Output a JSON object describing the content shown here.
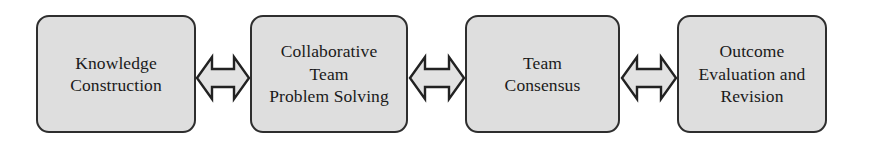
{
  "diagram": {
    "type": "linear-bidirectional-flow",
    "background_color": "#ffffff",
    "box_fill_color": "#dedede",
    "box_border_color": "#2e2e2e",
    "text_color": "#1a1a1a",
    "arrow_fill_color": "#e2e2e2",
    "arrow_stroke_color": "#222222",
    "nodes": [
      {
        "id": "knowledge-construction",
        "label": "Knowledge\nConstruction",
        "lines": [
          "Knowledge",
          "Construction"
        ],
        "x": 36,
        "y": 15,
        "width": 160,
        "height": 118
      },
      {
        "id": "collaborative-team-problem-solving",
        "label": "Collaborative\nTeam\nProblem Solving",
        "lines": [
          "Collaborative",
          "Team",
          "Problem Solving"
        ],
        "x": 250,
        "y": 15,
        "width": 158,
        "height": 118
      },
      {
        "id": "team-consensus",
        "label": "Team\nConsensus",
        "lines": [
          "Team",
          "Consensus"
        ],
        "x": 465,
        "y": 15,
        "width": 155,
        "height": 118
      },
      {
        "id": "outcome-evaluation-and-revision",
        "label": "Outcome\nEvaluation and\nRevision",
        "lines": [
          "Outcome",
          "Evaluation and",
          "Revision"
        ],
        "x": 677,
        "y": 15,
        "width": 150,
        "height": 118
      }
    ],
    "connectors": [
      {
        "id": "connector-1",
        "from": "knowledge-construction",
        "to": "collaborative-team-problem-solving",
        "direction": "bidirectional",
        "x": 195,
        "y": 45,
        "width": 56,
        "height": 66
      },
      {
        "id": "connector-2",
        "from": "collaborative-team-problem-solving",
        "to": "team-consensus",
        "direction": "bidirectional",
        "x": 408,
        "y": 45,
        "width": 58,
        "height": 66
      },
      {
        "id": "connector-3",
        "from": "team-consensus",
        "to": "outcome-evaluation-and-revision",
        "direction": "bidirectional",
        "x": 620,
        "y": 45,
        "width": 58,
        "height": 66
      }
    ]
  }
}
